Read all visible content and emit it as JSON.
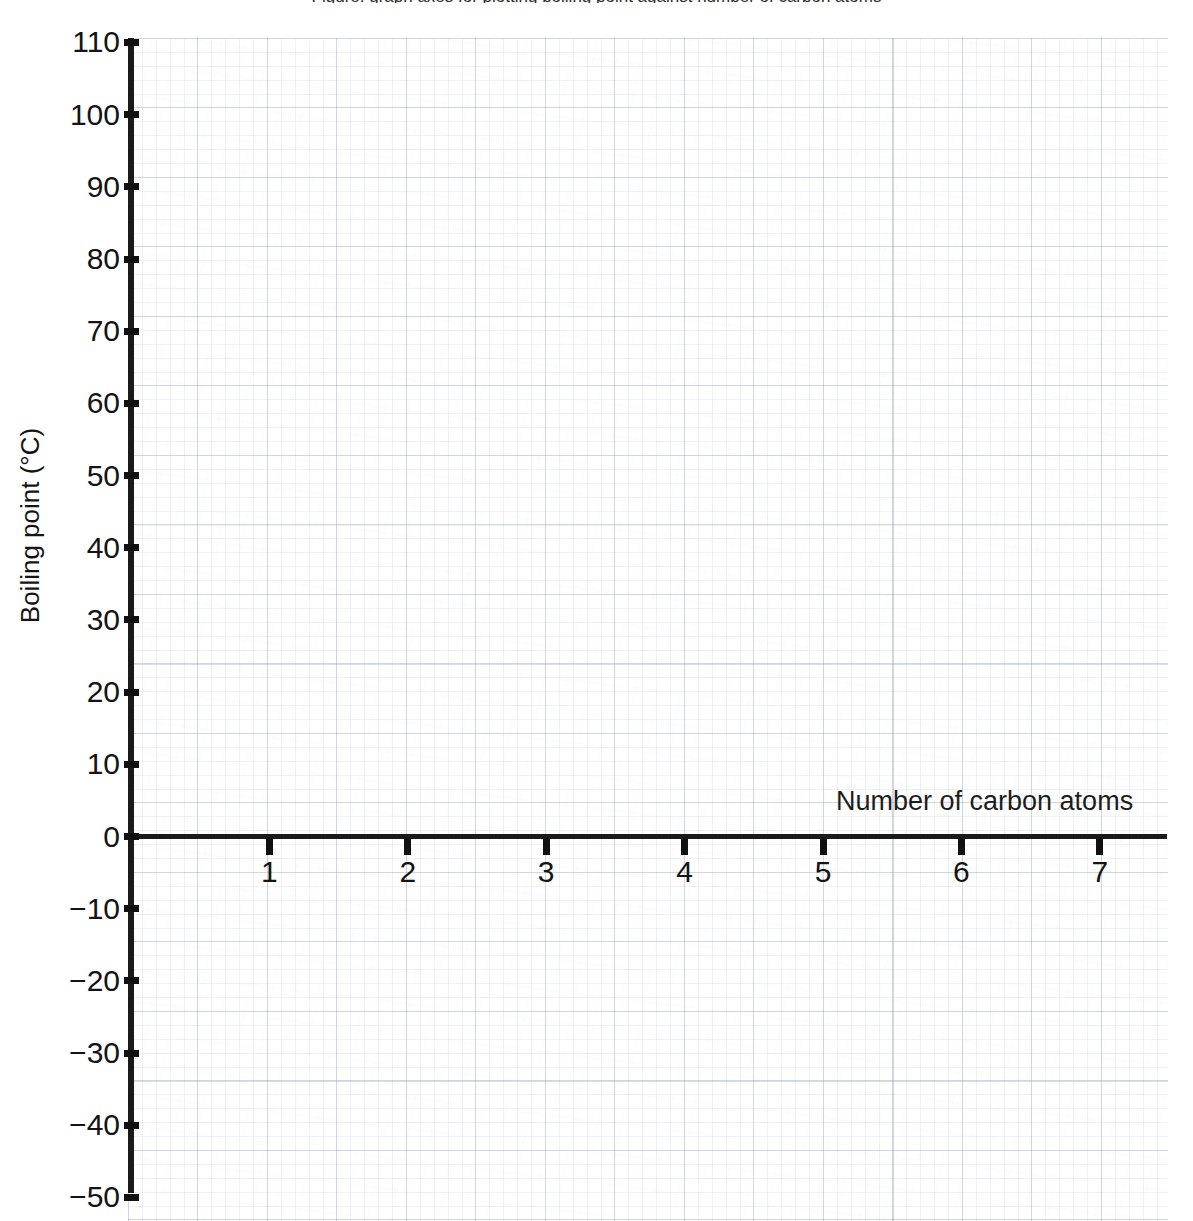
{
  "page": {
    "background_color": "#ffffff",
    "width": 1193,
    "height": 1221
  },
  "title": {
    "cut_off_text": "Figure: graph axes for plotting boiling point against number of carbon atoms"
  },
  "axis_titles": {
    "y": "Boiling point (°C)",
    "x": "Number of carbon atoms"
  },
  "colors": {
    "axis": "#1a1a1a",
    "tick": "#111111",
    "text": "#141414",
    "grid_major": "#96a0af",
    "grid_minor": "#a0aab9",
    "paper": "#ffffff"
  },
  "chart_data": {
    "type": "scatter",
    "title": "",
    "subtitle": "",
    "xlabel": "Number of carbon atoms",
    "ylabel": "Boiling point (°C)",
    "xlim": [
      0,
      7.5
    ],
    "ylim": [
      -50,
      110
    ],
    "x_ticks": [
      1,
      2,
      3,
      4,
      5,
      6,
      7
    ],
    "x_tick_labels": [
      "1",
      "2",
      "3",
      "4",
      "5",
      "6",
      "7"
    ],
    "y_ticks": [
      110,
      100,
      90,
      80,
      70,
      60,
      50,
      40,
      30,
      20,
      10,
      0,
      -10,
      -20,
      -30,
      -40,
      -50
    ],
    "y_tick_labels": [
      "110",
      "100",
      "90",
      "80",
      "70",
      "60",
      "50",
      "40",
      "30",
      "20",
      "10",
      "0",
      "−10",
      "−20",
      "−30",
      "−40",
      "−50"
    ],
    "grid": true,
    "grid_style": "graph-paper squares, major every 10 °C on y",
    "legend": null,
    "legend_position": "none",
    "series": [],
    "values": [],
    "categories": [],
    "annotations": [],
    "note": "Blank answer grid — no data points or curves are plotted."
  },
  "geometry": {
    "y_axis_x": 128,
    "y_axis_top": 38,
    "y_axis_bottom": 1193,
    "x_axis_y": 834,
    "x_axis_left": 128,
    "x_axis_right": 1167,
    "y_pixels_per_10deg": 72.1875,
    "x_pixels_per_unit": 138.4
  }
}
